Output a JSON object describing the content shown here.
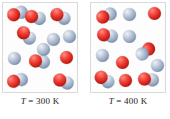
{
  "figure": {
    "colors": {
      "atom_red": "#d8281f",
      "atom_blue": "#9aaac2",
      "box_border": "#d9d9d9",
      "background": "#ffffff",
      "caption_text": "#1a1a1a"
    }
  },
  "panels": [
    {
      "id": "panel-300k",
      "caption": "T = 300 K",
      "caption_symbol": "T",
      "caption_equals": "=",
      "caption_value": "300 K",
      "temperature": 300,
      "temperature_unit": "K",
      "molecule_count": 12,
      "molecules": [
        {
          "type": "diatomic",
          "x": 4,
          "y": 4,
          "rot": -18,
          "atoms": [
            "red",
            "blue"
          ]
        },
        {
          "type": "diatomic",
          "x": 22,
          "y": 8,
          "rot": 14,
          "atoms": [
            "red",
            "blue"
          ]
        },
        {
          "type": "diatomic",
          "x": 47,
          "y": 7,
          "rot": 28,
          "atoms": [
            "red",
            "blue"
          ]
        },
        {
          "type": "diatomic",
          "x": 13,
          "y": 26,
          "rot": 42,
          "atoms": [
            "red",
            "blue"
          ]
        },
        {
          "type": "monatomic",
          "x": 44,
          "y": 30,
          "rot": 0,
          "atoms": [
            "blue"
          ]
        },
        {
          "type": "monatomic",
          "x": 60,
          "y": 27,
          "rot": 0,
          "atoms": [
            "blue"
          ]
        },
        {
          "type": "monatomic",
          "x": 5,
          "y": 49,
          "rot": 0,
          "atoms": [
            "blue"
          ]
        },
        {
          "type": "diatomic",
          "x": 26,
          "y": 52,
          "rot": 8,
          "atoms": [
            "red",
            "blue"
          ]
        },
        {
          "type": "monatomic",
          "x": 57,
          "y": 48,
          "rot": 0,
          "atoms": [
            "red"
          ]
        },
        {
          "type": "diatomic",
          "x": 4,
          "y": 71,
          "rot": -12,
          "atoms": [
            "red",
            "blue"
          ]
        },
        {
          "type": "diatomic",
          "x": 50,
          "y": 72,
          "rot": 22,
          "atoms": [
            "red",
            "blue"
          ]
        },
        {
          "type": "monatomic",
          "x": 34,
          "y": 40,
          "rot": 0,
          "atoms": [
            "blue"
          ]
        }
      ]
    },
    {
      "id": "panel-400k",
      "caption": "T = 400 K",
      "caption_symbol": "T",
      "caption_equals": "=",
      "caption_value": "400 K",
      "temperature": 400,
      "temperature_unit": "K",
      "molecule_count": 12,
      "molecules": [
        {
          "type": "diatomic",
          "x": 5,
          "y": 6,
          "rot": -22,
          "atoms": [
            "red",
            "blue"
          ]
        },
        {
          "type": "monatomic",
          "x": 32,
          "y": 5,
          "rot": 0,
          "atoms": [
            "blue"
          ]
        },
        {
          "type": "monatomic",
          "x": 57,
          "y": 4,
          "rot": 0,
          "atoms": [
            "red"
          ]
        },
        {
          "type": "diatomic",
          "x": 6,
          "y": 26,
          "rot": 10,
          "atoms": [
            "red",
            "blue"
          ]
        },
        {
          "type": "monatomic",
          "x": 32,
          "y": 27,
          "rot": 0,
          "atoms": [
            "blue"
          ]
        },
        {
          "type": "monatomic",
          "x": 5,
          "y": 46,
          "rot": 0,
          "atoms": [
            "blue"
          ]
        },
        {
          "type": "diatomic",
          "x": 44,
          "y": 42,
          "rot": -38,
          "atoms": [
            "blue",
            "red"
          ]
        },
        {
          "type": "monatomic",
          "x": 25,
          "y": 53,
          "rot": 0,
          "atoms": [
            "red"
          ]
        },
        {
          "type": "monatomic",
          "x": 60,
          "y": 56,
          "rot": 0,
          "atoms": [
            "blue"
          ]
        },
        {
          "type": "diatomic",
          "x": 3,
          "y": 70,
          "rot": 32,
          "atoms": [
            "red",
            "blue"
          ]
        },
        {
          "type": "monatomic",
          "x": 28,
          "y": 71,
          "rot": 0,
          "atoms": [
            "red"
          ]
        },
        {
          "type": "diatomic",
          "x": 47,
          "y": 70,
          "rot": 6,
          "atoms": [
            "red",
            "blue"
          ]
        }
      ]
    }
  ]
}
